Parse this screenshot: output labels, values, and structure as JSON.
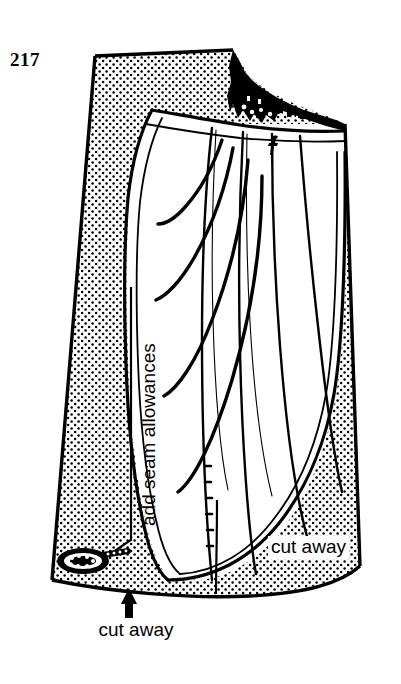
{
  "figure": {
    "number": "217",
    "kind": "pattern-drafting-diagram",
    "ink_color": "#000000",
    "paper_color": "#ffffff",
    "shading_color": "#000000",
    "shading_style": "stipple-dot-grid"
  },
  "labels": {
    "cut_away_bottom": "cut away",
    "cut_away_right": "cut away",
    "seam_allowances": "add seam allowances"
  },
  "annotations": {
    "arrow_bottom_direction": "up",
    "dark_region_note": "stepped closed darts at top right",
    "coil_note": "coiled detail at lower left"
  }
}
